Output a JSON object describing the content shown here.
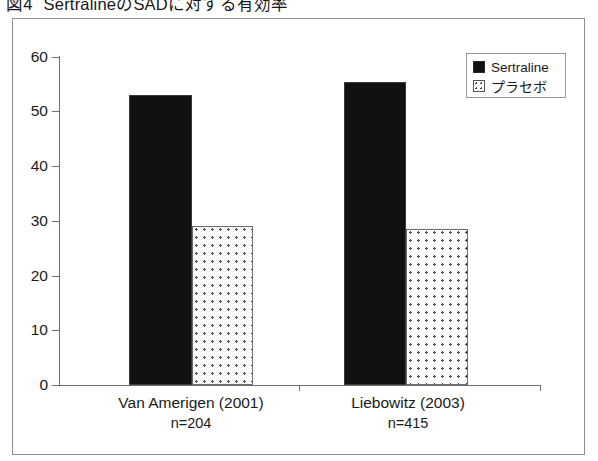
{
  "figure": {
    "caption_number": "図4",
    "caption_text": "SertralineのSADに対する有効率"
  },
  "legend": {
    "position": "top-right",
    "entries": [
      {
        "label": "Sertraline",
        "swatch": "solid-black-square-icon"
      },
      {
        "label": "プラセボ",
        "swatch": "dotted-white-square-icon"
      }
    ]
  },
  "chart_data": {
    "type": "bar",
    "title": "SertralineのSADに対する有効率",
    "xlabel": "",
    "ylabel": "",
    "ylim": [
      0,
      60
    ],
    "yticks": [
      0,
      10,
      20,
      30,
      40,
      50,
      60
    ],
    "ytick_labels": [
      "0",
      "10",
      "20",
      "30",
      "40",
      "50",
      "60"
    ],
    "grid": false,
    "legend_position": "upper right",
    "categories": [
      "Van Amerigen (2001)",
      "Liebowitz (2003)"
    ],
    "category_sublabels": [
      "n=204",
      "n=415"
    ],
    "series": [
      {
        "name": "Sertraline",
        "values": [
          53,
          55.5
        ]
      },
      {
        "name": "プラセボ",
        "values": [
          29,
          28.5
        ]
      }
    ]
  },
  "axis": {
    "ticks": [
      {
        "value": 60,
        "label": "60"
      },
      {
        "value": 50,
        "label": "50"
      },
      {
        "value": 40,
        "label": "40"
      },
      {
        "value": 30,
        "label": "30"
      },
      {
        "value": 20,
        "label": "20"
      },
      {
        "value": 10,
        "label": "10"
      },
      {
        "value": 0,
        "label": "0"
      }
    ]
  },
  "categories": [
    {
      "name": "Van Amerigen (2001)",
      "n": "n=204"
    },
    {
      "name": "Liebowitz (2003)",
      "n": "n=415"
    }
  ],
  "colors": {
    "sertraline": "#111111",
    "placebo_fill": "#ffffff",
    "placebo_dots": "#3d3d3d",
    "axis": "#6d6d6d",
    "frame": "#8f8f8f",
    "text": "#1a1a1a"
  }
}
